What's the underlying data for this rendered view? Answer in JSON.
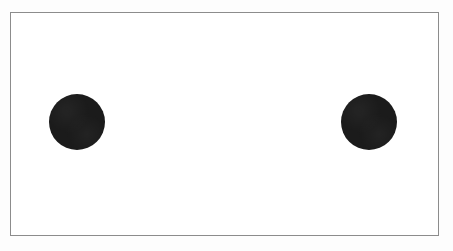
{
  "figure": {
    "title": "",
    "caption": "",
    "background_color": "#ffffff",
    "frame_color": "#8c8c8c",
    "frame_width_px": 1,
    "canvas_width_px": 453,
    "canvas_height_px": 251,
    "frame": {
      "x": 10,
      "y": 12,
      "width": 429,
      "height": 224
    }
  },
  "chart_data": {
    "type": "scatter",
    "title": "",
    "subtitle": "",
    "xlabel": "",
    "ylabel": "",
    "grid": false,
    "legend": null,
    "axis_ticks": [],
    "tick_labels": [],
    "annotations": [],
    "xlim": [
      0,
      429
    ],
    "ylim": [
      0,
      224
    ],
    "marker_shape": "circle",
    "marker_color": "#1b1b1b",
    "marker_diameter_px": 56,
    "series": [
      {
        "name": "dots",
        "color": "#1b1b1b",
        "points": [
          {
            "label": "left-dot",
            "x": 66,
            "y": 109,
            "diameter": 56
          },
          {
            "label": "right-dot",
            "x": 358,
            "y": 109,
            "diameter": 56
          }
        ]
      }
    ],
    "point_count": 2
  },
  "elements": {
    "left_dot": {
      "name": "left-dot",
      "color": "#1b1b1b",
      "diameter_px": 56,
      "center_x_px": 76,
      "center_y_px": 121
    },
    "right_dot": {
      "name": "right-dot",
      "color": "#1b1b1b",
      "diameter_px": 56,
      "center_x_px": 368,
      "center_y_px": 121
    }
  },
  "accessibility": {
    "figure_description": "Two solid black circles of equal size placed symmetrically left and right inside a thin gray rectangular border on a white background."
  }
}
